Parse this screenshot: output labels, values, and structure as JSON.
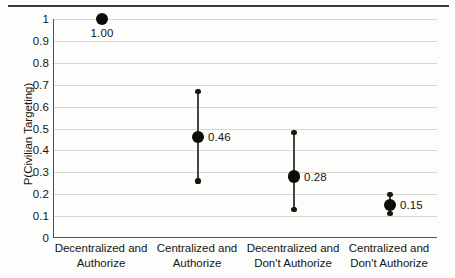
{
  "chart_data": {
    "type": "scatter",
    "title": "",
    "xlabel": "",
    "ylabel": "P(Civilian Targeting)",
    "ylim": [
      0,
      1
    ],
    "yticks": [
      "0",
      "0.1",
      "0.2",
      "0.3",
      "0.4",
      "0.5",
      "0.6",
      "0.7",
      "0.8",
      "0.9",
      "1"
    ],
    "grid": true,
    "legend": "none",
    "categories": [
      "Decentralized and Authorize",
      "Centralized and Authorize",
      "Decentralized and Don't Authorize",
      "Centralized and Don't Authorize"
    ],
    "category_lines": [
      {
        "line1": "Decentralized and",
        "line2": "Authorize"
      },
      {
        "line1": "Centralized and",
        "line2": "Authorize"
      },
      {
        "line1": "Decentralized and",
        "line2": "Don't Authorize"
      },
      {
        "line1": "Centralized and",
        "line2": "Don't Authorize"
      }
    ],
    "values": [
      1.0,
      0.46,
      0.28,
      0.15
    ],
    "value_labels": [
      "1.00",
      "0.46",
      "0.28",
      "0.15"
    ],
    "error_low": [
      1.0,
      0.26,
      0.13,
      0.11
    ],
    "error_high": [
      1.0,
      0.67,
      0.48,
      0.2
    ],
    "label_placement": [
      "below",
      "side",
      "side",
      "side"
    ],
    "marker_color": "#0d0c09",
    "errorbar_color": "#45433f",
    "gridline_color": "#d8d6d2",
    "axis_color": "#55524e",
    "background_color": "#fdfdfb"
  }
}
